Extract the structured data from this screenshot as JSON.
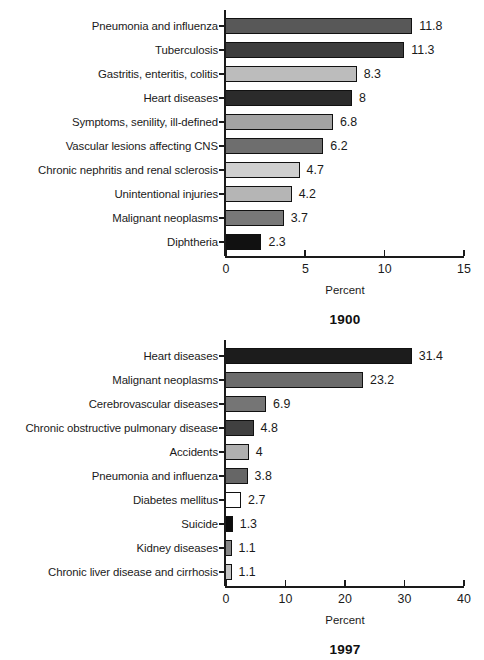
{
  "figure": {
    "panels": [
      {
        "id": "1900",
        "title": "1900",
        "xlabel": "Percent",
        "xticks": [
          "0",
          "5",
          "10",
          "15"
        ]
      },
      {
        "id": "1997",
        "title": "1997",
        "xlabel": "Percent",
        "xticks": [
          "0",
          "10",
          "20",
          "30",
          "40"
        ]
      }
    ]
  },
  "chart_data": [
    {
      "type": "bar",
      "orientation": "horizontal",
      "title": "1900",
      "xlabel": "Percent",
      "ylabel": "",
      "xlim": [
        0,
        15
      ],
      "xticks": [
        0,
        5,
        10,
        15
      ],
      "grid": false,
      "legend": false,
      "categories": [
        "Pneumonia and influenza",
        "Tuberculosis",
        "Gastritis, enteritis, colitis",
        "Heart diseases",
        "Symptoms, senility, ill-defined",
        "Vascular lesions affecting CNS",
        "Chronic nephritis and renal sclerosis",
        "Unintentional injuries",
        "Malignant neoplasms",
        "Diphtheria"
      ],
      "values": [
        11.8,
        11.3,
        8.3,
        8,
        6.8,
        6.2,
        4.7,
        4.2,
        3.7,
        2.3
      ],
      "value_labels": [
        "11.8",
        "11.3",
        "8.3",
        "8",
        "6.8",
        "6.2",
        "4.7",
        "4.2",
        "3.7",
        "2.3"
      ],
      "bar_colors": [
        "#585858",
        "#3d3d3d",
        "#bcbcbc",
        "#2b2b2b",
        "#a3a3a3",
        "#6e6e6e",
        "#cfcfcf",
        "#b5b5b5",
        "#787878",
        "#111111"
      ]
    },
    {
      "type": "bar",
      "orientation": "horizontal",
      "title": "1997",
      "xlabel": "Percent",
      "ylabel": "",
      "xlim": [
        0,
        40
      ],
      "xticks": [
        0,
        10,
        20,
        30,
        40
      ],
      "grid": false,
      "legend": false,
      "categories": [
        "Heart diseases",
        "Malignant neoplasms",
        "Cerebrovascular diseases",
        "Chronic obstructive pulmonary disease",
        "Accidents",
        "Pneumonia and influenza",
        "Diabetes mellitus",
        "Suicide",
        "Kidney diseases",
        "Chronic liver disease and cirrhosis"
      ],
      "values": [
        31.4,
        23.2,
        6.9,
        4.8,
        4,
        3.8,
        2.7,
        1.3,
        1.1,
        1.1
      ],
      "value_labels": [
        "31.4",
        "23.2",
        "6.9",
        "4.8",
        "4",
        "3.8",
        "2.7",
        "1.3",
        "1.1",
        "1.1"
      ],
      "bar_colors": [
        "#1c1c1c",
        "#6b6b6b",
        "#757575",
        "#404040",
        "#b0b0b0",
        "#666666",
        "#ffffff",
        "#0d0d0d",
        "#878787",
        "#c4c4c4"
      ]
    }
  ]
}
